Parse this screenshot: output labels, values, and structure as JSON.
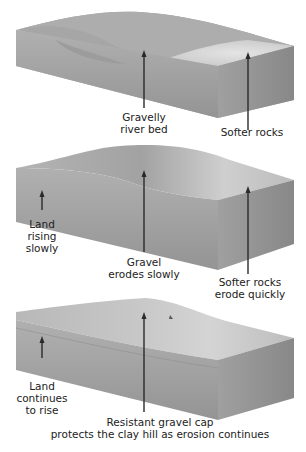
{
  "diagram": {
    "panels": [
      {
        "id": "stage-1",
        "labels": [
          {
            "text": "Gravelly\nriver bed"
          },
          {
            "text": "Softer rocks"
          }
        ]
      },
      {
        "id": "stage-2",
        "labels": [
          {
            "text": "Land\nrising\nslowly"
          },
          {
            "text": "Gravel\nerodes slowly"
          },
          {
            "text": "Softer rocks\nerode quickly"
          }
        ]
      },
      {
        "id": "stage-3",
        "labels": [
          {
            "text": "Land\ncontinues\nto rise"
          },
          {
            "text": "Resistant gravel cap\nprotects the clay hill as erosion continues"
          }
        ]
      }
    ],
    "colors": {
      "top_surface": "#a8a8a8",
      "soft_rock": "#d8d8d8",
      "front_face": "#9a9a9a",
      "side_face": "#8c8c8c",
      "arrow": "#2a2a2a",
      "text": "#222222"
    }
  }
}
